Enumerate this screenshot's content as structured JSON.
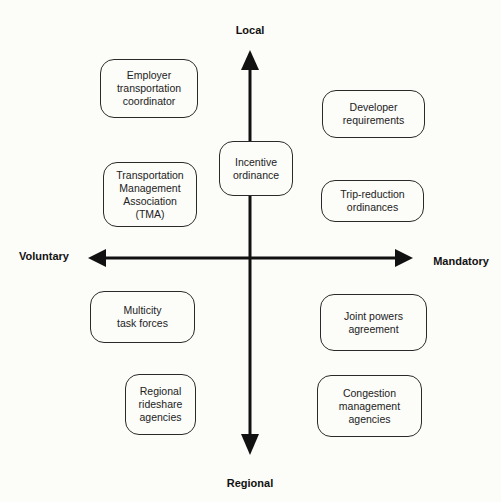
{
  "diagram": {
    "type": "quadrant",
    "axes": {
      "top": "Local",
      "bottom": "Regional",
      "left": "Voluntary",
      "right": "Mandatory"
    },
    "boxes": [
      {
        "id": "employer",
        "lines": [
          "Employer",
          "transportation",
          "coordinator"
        ],
        "quadrant": "local-voluntary"
      },
      {
        "id": "tma",
        "lines": [
          "Transportation",
          "Management",
          "Association",
          "(TMA)"
        ],
        "quadrant": "local-voluntary"
      },
      {
        "id": "incentive",
        "lines": [
          "Incentive",
          "ordinance"
        ],
        "quadrant": "center-local"
      },
      {
        "id": "developer",
        "lines": [
          "Developer",
          "requirements"
        ],
        "quadrant": "local-mandatory"
      },
      {
        "id": "trip",
        "lines": [
          "Trip-reduction",
          "ordinances"
        ],
        "quadrant": "local-mandatory"
      },
      {
        "id": "multicity",
        "lines": [
          "Multicity",
          "task forces"
        ],
        "quadrant": "regional-voluntary"
      },
      {
        "id": "rideshare",
        "lines": [
          "Regional",
          "rideshare",
          "agencies"
        ],
        "quadrant": "regional-voluntary"
      },
      {
        "id": "joint",
        "lines": [
          "Joint powers",
          "agreement"
        ],
        "quadrant": "regional-mandatory"
      },
      {
        "id": "congestion",
        "lines": [
          "Congestion",
          "management",
          "agencies"
        ],
        "quadrant": "regional-mandatory"
      }
    ]
  },
  "colors": {
    "background": "#fcfcf9",
    "stroke": "#111111",
    "box_border": "#2a2a2a",
    "text": "#222222"
  }
}
